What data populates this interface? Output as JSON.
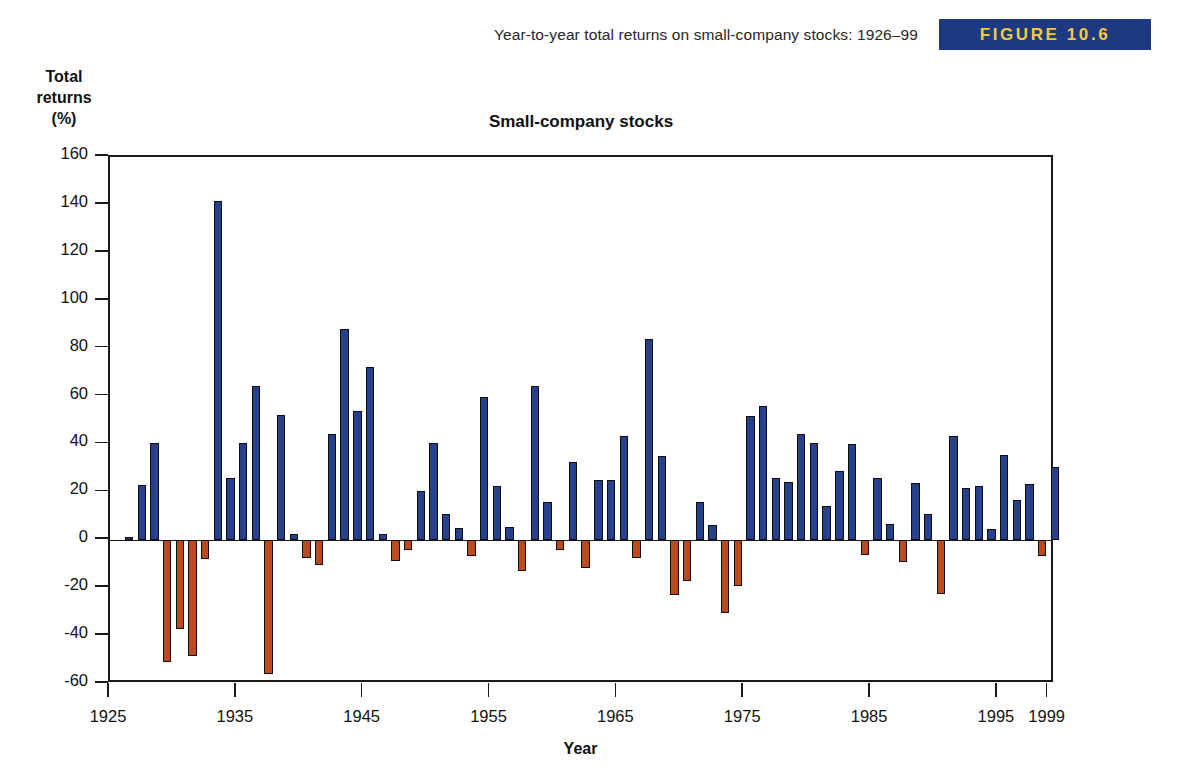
{
  "figure": {
    "caption": "Year-to-year total returns on small-company stocks: 1926–99",
    "badge_label": "FIGURE 10.6",
    "badge_bg": "#1b3a81",
    "badge_fg": "#f5c842"
  },
  "axis_caption": {
    "line1": "Total",
    "line2": "returns",
    "line3": "(%)"
  },
  "chart_data": {
    "type": "bar",
    "title": "Small-company stocks",
    "xlabel": "Year",
    "ylabel": "Total returns (%)",
    "ylim": [
      -60,
      160
    ],
    "yticks": [
      160,
      140,
      120,
      100,
      80,
      60,
      40,
      20,
      0,
      -20,
      -40,
      -60
    ],
    "ytick_labels": [
      "160",
      "140",
      "120",
      "100",
      "80",
      "60",
      "40",
      "20",
      "0",
      "-20",
      "-40",
      "-60"
    ],
    "xticks": [
      1925,
      1935,
      1945,
      1955,
      1965,
      1975,
      1985,
      1995,
      1999
    ],
    "xtick_labels": [
      "1925",
      "1935",
      "1945",
      "1955",
      "1965",
      "1975",
      "1985",
      "1995",
      "1999"
    ],
    "xlim": [
      1925,
      1999.5
    ],
    "grid": false,
    "legend": null,
    "positive_color": "#27408b",
    "negative_color": "#bd4a1d",
    "categories": [
      1926,
      1927,
      1928,
      1929,
      1930,
      1931,
      1932,
      1933,
      1934,
      1935,
      1936,
      1937,
      1938,
      1939,
      1940,
      1941,
      1942,
      1943,
      1944,
      1945,
      1946,
      1947,
      1948,
      1949,
      1950,
      1951,
      1952,
      1953,
      1954,
      1955,
      1956,
      1957,
      1958,
      1959,
      1960,
      1961,
      1962,
      1963,
      1964,
      1965,
      1966,
      1967,
      1968,
      1969,
      1970,
      1971,
      1972,
      1973,
      1974,
      1975,
      1976,
      1977,
      1978,
      1979,
      1980,
      1981,
      1982,
      1983,
      1984,
      1985,
      1986,
      1987,
      1988,
      1989,
      1990,
      1991,
      1992,
      1993,
      1994,
      1995,
      1996,
      1997,
      1998,
      1999
    ],
    "values": [
      1.5,
      23.0,
      40.5,
      -51.0,
      -37.0,
      -48.5,
      -8.0,
      141.5,
      26.0,
      40.5,
      64.5,
      -56.0,
      52.5,
      2.5,
      -7.5,
      -10.5,
      44.5,
      88.0,
      54.0,
      72.5,
      2.5,
      -8.5,
      -4.0,
      20.5,
      40.5,
      11.0,
      5.0,
      -6.5,
      60.0,
      22.5,
      5.5,
      -13.0,
      64.5,
      16.0,
      -4.0,
      32.5,
      -11.5,
      25.0,
      25.0,
      43.5,
      -7.5,
      84.0,
      35.0,
      -23.0,
      -17.0,
      16.0,
      6.5,
      -30.5,
      -19.0,
      52.0,
      56.0,
      26.0,
      24.5,
      44.5,
      40.5,
      14.5,
      29.0,
      40.0,
      -6.0,
      26.0,
      7.0,
      -9.0,
      24.0,
      11.0,
      -22.5,
      43.5,
      22.0,
      22.5,
      4.5,
      35.5,
      17.0,
      23.5,
      -6.5,
      30.5
    ]
  }
}
